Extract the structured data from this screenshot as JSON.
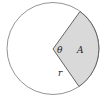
{
  "diagram": {
    "type": "circle-sector",
    "circle": {
      "cx": 53,
      "cy": 48.5,
      "r": 46,
      "stroke": "#888888",
      "fill": "#ffffff"
    },
    "sector": {
      "vertex": [
        53,
        49
      ],
      "arc_start": [
        80,
        11.5
      ],
      "arc_end": [
        79,
        86.5
      ],
      "fill": "#d9d9d9",
      "stroke": "#555555"
    },
    "labels": {
      "angle": "θ",
      "area": "A",
      "radius": "r"
    }
  }
}
